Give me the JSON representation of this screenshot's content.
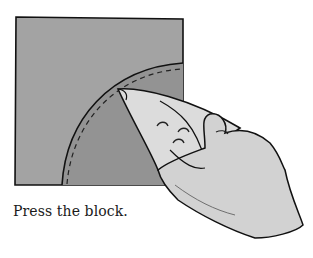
{
  "figure": {
    "caption": "Press the block.",
    "elements": {
      "fabric_block": "square quilt block, light gray",
      "curved_piece": "quarter-circle inset with dashed stitching line",
      "tool": "iron-icon",
      "hand": "hand-icon"
    },
    "colors": {
      "block_fill": "#a3a3a3",
      "curve_fill": "#939393",
      "iron_fill": "#dcdcdc",
      "hand_fill": "#d2d2d2",
      "outline": "#111111"
    }
  }
}
